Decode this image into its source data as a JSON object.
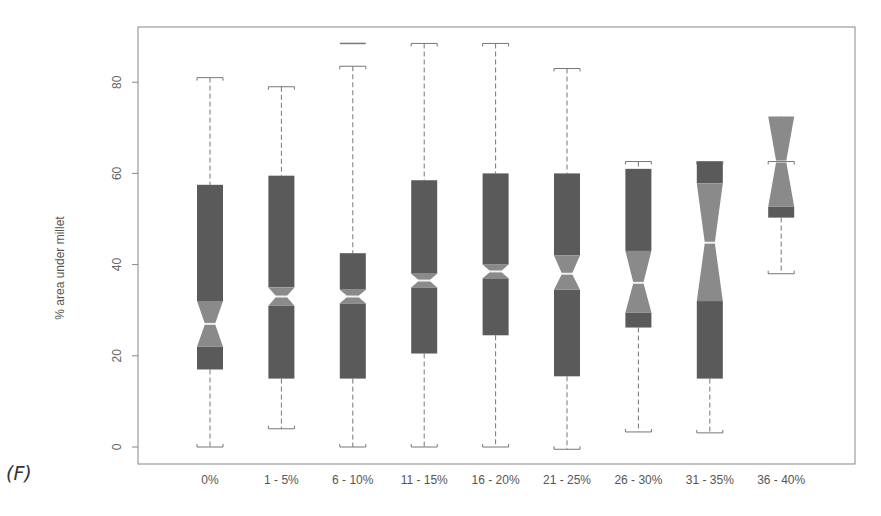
{
  "panel_label": "(F)",
  "chart_data": {
    "type": "boxplot",
    "notched": true,
    "title": "",
    "xlabel": "",
    "ylabel": "% area under millet",
    "ylim": [
      -3,
      92
    ],
    "yticks": [
      0,
      20,
      40,
      60,
      80
    ],
    "categories": [
      "0%",
      "1 - 5%",
      "6 - 10%",
      "11 - 15%",
      "16 - 20%",
      "21 - 25%",
      "26 - 30%",
      "31 - 35%",
      "36 - 40%"
    ],
    "boxes": [
      {
        "category": "0%",
        "whisker_low": 0,
        "q1": 17,
        "notch_low": 22,
        "median": 27,
        "notch_high": 32,
        "q3": 57.5,
        "whisker_high": 81,
        "outliers": []
      },
      {
        "category": "1 - 5%",
        "whisker_low": 4,
        "q1": 15,
        "notch_low": 31,
        "median": 33,
        "notch_high": 35,
        "q3": 59.5,
        "whisker_high": 79,
        "outliers": []
      },
      {
        "category": "6 - 10%",
        "whisker_low": 0,
        "q1": 15,
        "notch_low": 31.5,
        "median": 33,
        "notch_high": 34.5,
        "q3": 42.5,
        "whisker_high": 83.5,
        "outliers": [
          88.5
        ]
      },
      {
        "category": "11 - 15%",
        "whisker_low": 0,
        "q1": 20.5,
        "notch_low": 35,
        "median": 36.5,
        "notch_high": 38,
        "q3": 58.5,
        "whisker_high": 88.5,
        "outliers": []
      },
      {
        "category": "16 - 20%",
        "whisker_low": 0,
        "q1": 24.5,
        "notch_low": 37,
        "median": 38.5,
        "notch_high": 40,
        "q3": 60,
        "whisker_high": 88.5,
        "outliers": []
      },
      {
        "category": "21 - 25%",
        "whisker_low": -0.5,
        "q1": 15.5,
        "notch_low": 34.5,
        "median": 38,
        "notch_high": 42,
        "q3": 60,
        "whisker_high": 83,
        "outliers": []
      },
      {
        "category": "26 - 30%",
        "whisker_low": 3.3,
        "q1": 26.2,
        "notch_low": 29.5,
        "median": 36,
        "notch_high": 43,
        "q3": 61,
        "whisker_high": 62.6,
        "outliers": []
      },
      {
        "category": "31 - 35%",
        "whisker_low": 3.1,
        "q1": 15,
        "notch_low": 32,
        "median": 44.8,
        "notch_high": 57.8,
        "q3": 62.6,
        "whisker_high": 62.6,
        "outliers": []
      },
      {
        "category": "36 - 40%",
        "whisker_low": 38,
        "q1": 50.3,
        "notch_low": 52.7,
        "median": 62.6,
        "notch_high": 72.5,
        "q3": 72.5,
        "whisker_high": 62.6,
        "outliers": []
      }
    ],
    "colors": {
      "box_dark": "#5a5a5a",
      "box_notch": "#8a8a8a",
      "median": "#f0f0f0",
      "whisker": "#777777",
      "axis": "#888888"
    },
    "grid": false,
    "legend": null
  }
}
